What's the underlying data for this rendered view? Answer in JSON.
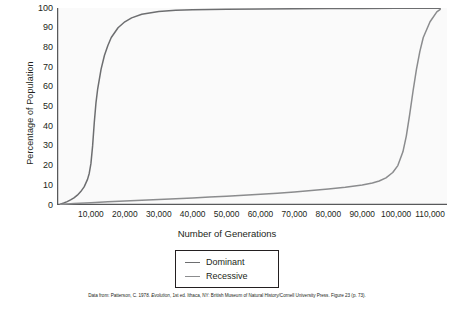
{
  "chart_data": {
    "type": "line",
    "title": "",
    "xlabel": "Number of Generations",
    "ylabel": "Percentage of Population",
    "xlim": [
      0,
      115000
    ],
    "ylim": [
      0,
      100
    ],
    "grid": false,
    "legend_position": "bottom-center",
    "xticks": [
      "10,000",
      "20,000",
      "30,000",
      "40,000",
      "50,000",
      "60,000",
      "70,000",
      "80,000",
      "90,000",
      "100,000",
      "110,000"
    ],
    "xtick_values": [
      10000,
      20000,
      30000,
      40000,
      50000,
      60000,
      70000,
      80000,
      90000,
      100000,
      110000
    ],
    "yticks": [
      "0",
      "10",
      "20",
      "30",
      "40",
      "50",
      "60",
      "70",
      "80",
      "90",
      "100"
    ],
    "ytick_values": [
      0,
      10,
      20,
      30,
      40,
      50,
      60,
      70,
      80,
      90,
      100
    ],
    "series": [
      {
        "name": "Dominant",
        "color": "#6d6e70",
        "x": [
          1000,
          2000,
          3000,
          4000,
          5000,
          6000,
          7000,
          8000,
          9000,
          9500,
          10000,
          10500,
          11000,
          11500,
          12000,
          13000,
          14000,
          15000,
          16000,
          18000,
          20000,
          22000,
          25000,
          30000,
          35000,
          40000,
          50000,
          60000,
          70000,
          80000,
          90000,
          100000,
          110000,
          113000
        ],
        "y": [
          0.4,
          1.0,
          1.7,
          2.6,
          3.6,
          5.0,
          6.8,
          9.2,
          13.0,
          16.0,
          21.0,
          30.0,
          42.0,
          52.0,
          59.0,
          69.0,
          76.0,
          81.0,
          85.0,
          90.0,
          93.0,
          95.0,
          96.8,
          98.2,
          98.8,
          99.1,
          99.4,
          99.5,
          99.6,
          99.7,
          99.8,
          99.85,
          99.9,
          99.9
        ]
      },
      {
        "name": "Recessive",
        "color": "#8b8c8e",
        "x": [
          1000,
          5000,
          10000,
          15000,
          20000,
          25000,
          30000,
          35000,
          40000,
          45000,
          50000,
          55000,
          60000,
          65000,
          70000,
          75000,
          80000,
          85000,
          90000,
          93000,
          95000,
          97000,
          99000,
          100500,
          102000,
          103000,
          104000,
          105000,
          106000,
          107000,
          108000,
          110000,
          112000,
          113000
        ],
        "y": [
          0.3,
          0.7,
          1.2,
          1.6,
          2.0,
          2.4,
          2.8,
          3.2,
          3.6,
          4.0,
          4.4,
          4.9,
          5.4,
          6.0,
          6.6,
          7.3,
          8.1,
          9.0,
          10.2,
          11.2,
          12.2,
          13.8,
          16.5,
          20.0,
          27.0,
          35.0,
          46.0,
          58.0,
          69.0,
          78.0,
          85.0,
          93.0,
          98.0,
          99.3
        ]
      }
    ]
  },
  "legend": {
    "items": [
      {
        "label": "Dominant",
        "color": "#6d6e70"
      },
      {
        "label": "Recessive",
        "color": "#8b8c8e"
      }
    ]
  },
  "citation": {
    "prefix": "Data from: Patterson, C. 1978. ",
    "italic": "Evolution",
    "suffix": ", 1st ed. Ithaca, NY: British Museum of Natural History/Cornell University Press. Figure 23 (p. 73)."
  },
  "axis": {
    "color": "#58595b"
  }
}
